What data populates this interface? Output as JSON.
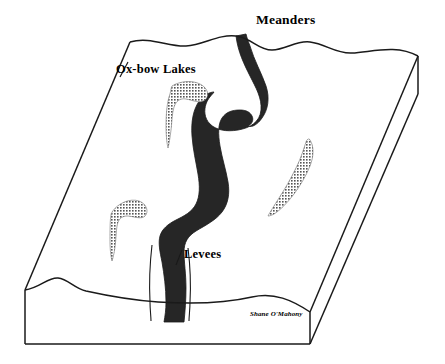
{
  "diagram": {
    "labels": {
      "meanders": "Meanders",
      "oxbow_lakes": "Ox-bow Lakes",
      "levees": "Levees"
    },
    "credit": "Shane O'Mahony",
    "colors": {
      "outline": "#1a1a1a",
      "river_fill": "#262626",
      "oxbow_fill": "#8c8c8c",
      "background": "#ffffff"
    },
    "features": [
      {
        "name": "river-channel",
        "type": "meandering-river",
        "fill": "#262626",
        "description": "Dark sinuous channel winding from the back edge to the front edge of the block"
      },
      {
        "name": "oxbow-lake-upper-left",
        "type": "ox-bow-lake",
        "fill": "#8c8c8c",
        "description": "Hook shaped abandoned meander left of the channel near the top"
      },
      {
        "name": "oxbow-lake-lower-left",
        "type": "ox-bow-lake",
        "fill": "#8c8c8c",
        "description": "Hook shaped abandoned meander on the lower left of the floodplain"
      },
      {
        "name": "oxbow-lake-right",
        "type": "ox-bow-lake",
        "fill": "#8c8c8c",
        "description": "Elongated crescent abandoned meander on the right of the floodplain"
      },
      {
        "name": "levee-left",
        "type": "levee",
        "description": "Thin raised bank line along the west side of the channel"
      },
      {
        "name": "levee-right",
        "type": "levee",
        "description": "Thin raised bank line along the east side of the channel"
      }
    ],
    "block": {
      "name": "floodplain-block",
      "description": "Three dimensional block diagram with a wavy top surface, a front cut face and a right side cut face"
    }
  }
}
